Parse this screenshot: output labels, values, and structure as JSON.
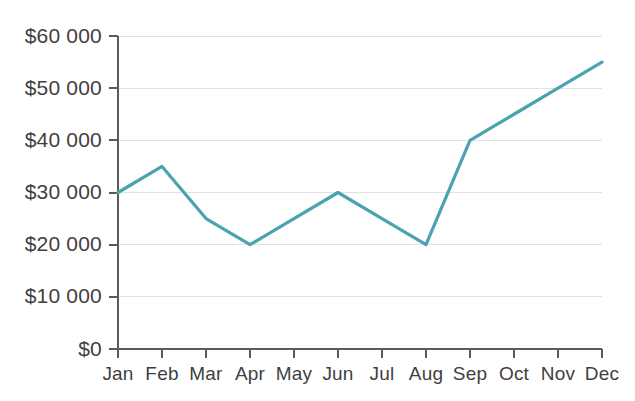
{
  "chart_data": {
    "type": "line",
    "title": "",
    "subtitle": "",
    "xlabel": "",
    "ylabel": "",
    "categories": [
      "Jan",
      "Feb",
      "Mar",
      "Apr",
      "May",
      "Jun",
      "Jul",
      "Aug",
      "Sep",
      "Oct",
      "Nov",
      "Dec"
    ],
    "series": [
      {
        "name": "Revenue",
        "color": "#4ba3b0",
        "values": [
          30000,
          35000,
          25000,
          20000,
          25000,
          30000,
          25000,
          20000,
          40000,
          45000,
          50000,
          55000
        ]
      }
    ],
    "ylim": [
      0,
      60000
    ],
    "yticks": [
      0,
      10000,
      20000,
      30000,
      40000,
      50000,
      60000
    ],
    "ytick_labels": [
      "$0",
      "$10 000",
      "$20 000",
      "$30 000",
      "$40 000",
      "$50 000",
      "$60 000"
    ],
    "xtick_labels": [
      "Jan",
      "Feb",
      "Mar",
      "Apr",
      "May",
      "Jun",
      "Jul",
      "Aug",
      "Sep",
      "Oct",
      "Nov",
      "Dec"
    ],
    "grid": "horizontal",
    "legend": "none",
    "markers": false
  },
  "style": {
    "line_color": "#4ba3b0",
    "grid_color": "#e2e2e2",
    "axis_color": "#5a5a5a",
    "text_color": "#3f3f3f",
    "background": "#ffffff"
  },
  "geometry": {
    "plot_left": 118,
    "plot_right": 602,
    "plot_top": 36,
    "plot_bottom": 349
  }
}
